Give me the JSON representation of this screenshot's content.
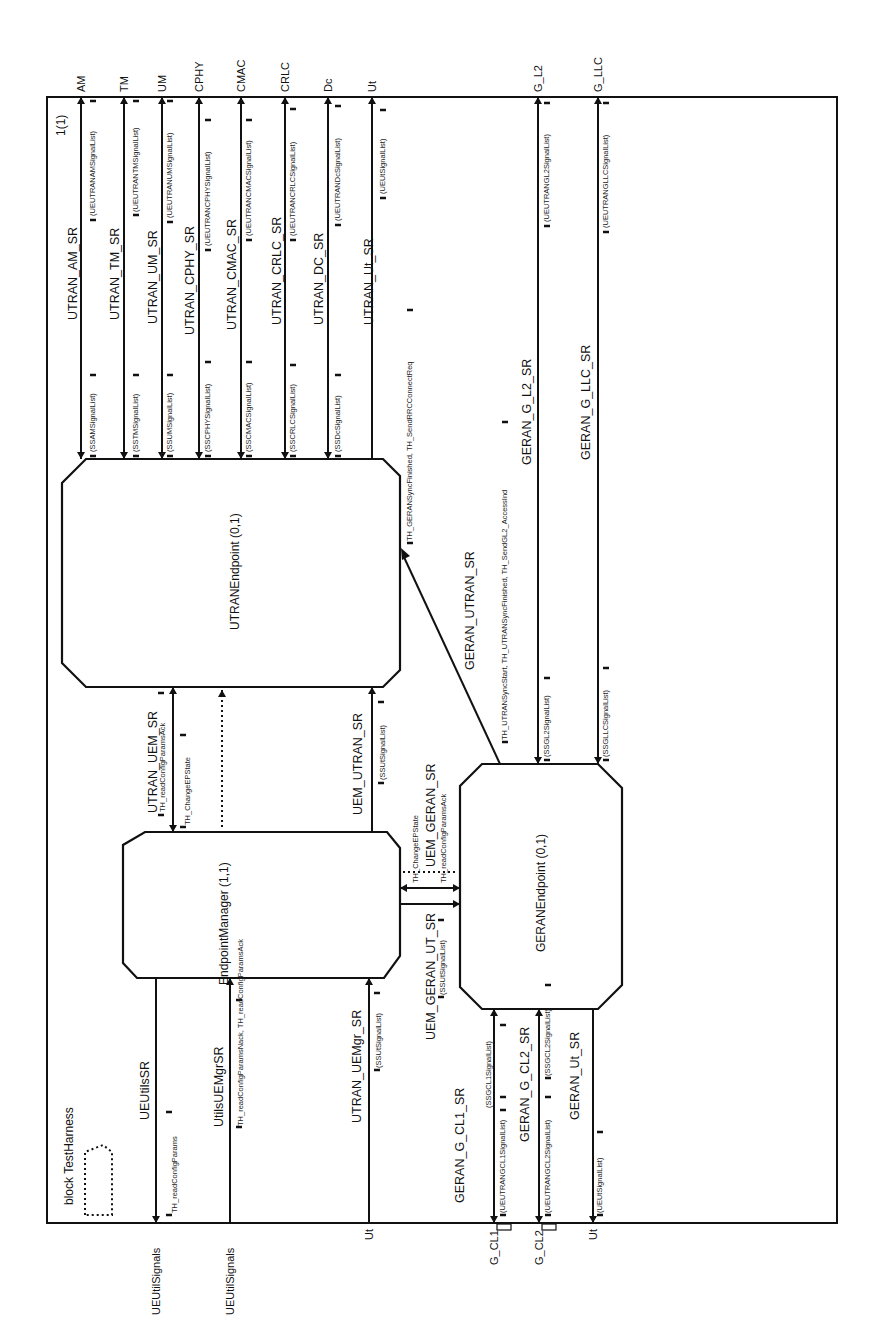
{
  "diagram": {
    "title": "block TestHarness",
    "page": "1(1)",
    "orientation": "rotated-90-ccw",
    "colors": {
      "line": "#111111",
      "background": "#ffffff"
    },
    "blocks": {
      "utran": "UTRANEndpoint (0,1)",
      "manager": "EndpointManager (1,1)",
      "geran": "GERANEndpoint (0,1)"
    },
    "top_channels": [
      {
        "name": "AM",
        "route": "UTRAN_AM_SR",
        "in": "(UEUTRANAMSignalList)",
        "out": "(SSAMSignalList)"
      },
      {
        "name": "TM",
        "route": "UTRAN_TM_SR",
        "in": "(UEUTRANTMSignalList)",
        "out": "(SSTMSignalList)"
      },
      {
        "name": "UM",
        "route": "UTRAN_UM_SR",
        "in": "(UEUTRANUMSignalList)",
        "out": "(SSUMSignalList)"
      },
      {
        "name": "CPHY",
        "route": "UTRAN_CPHY_SR",
        "in": "(UEUTRANCPHYSignalList)",
        "out": "(SSCPHYSignalList)"
      },
      {
        "name": "CMAC",
        "route": "UTRAN_CMAC_SR",
        "in": "(UEUTRANCMACSignalList)",
        "out": "(SSCMACSignalList)"
      },
      {
        "name": "CRLC",
        "route": "UTRAN_CRLC_SR",
        "in": "(UEUTRANCRLCSignalList)",
        "out": "(SSCRLCSignalList)"
      },
      {
        "name": "Dc",
        "route": "UTRAN_DC_SR",
        "in": "(UEUTRANDcSignalList)",
        "out": "(SSDcSignalList)"
      },
      {
        "name": "Ut",
        "route": "UTRAN_Ut_SR",
        "in": "(UEUtSignalList)",
        "out": ""
      },
      {
        "name": "G_L2",
        "route": "GERAN_G_L2_SR",
        "in": "(UEUTRANGL2SignalList)",
        "out": "(SSGL2SignalList)"
      },
      {
        "name": "G_LLC",
        "route": "GERAN_G_LLC_SR",
        "in": "(UEUTRANGLLCSignalList)",
        "out": "(SSGLLCSignalList)"
      }
    ],
    "bottom_channels": [
      {
        "name": "UEUtilSignals",
        "route": "UEUtilsSR",
        "sig": "TH_readConfigParams"
      },
      {
        "name": "UEUtilSignals",
        "route": "UtilsUEMgrSR",
        "sig": "TH_readConfigParamsNack, TH_readConfigParamsAck"
      },
      {
        "name": "Ut",
        "route": "UTRAN_UEMgr_SR",
        "sig": "(SSUtSignalList)"
      },
      {
        "name": "G_CL1",
        "route": "GERAN_G_CL1_SR",
        "sig": "(UEUTRANGCL1SignalList)",
        "sig2": "(SSGCL1SignalList)"
      },
      {
        "name": "G_CL2",
        "route": "GERAN_G_CL2_SR",
        "sig": "(UEUTRANGCL2SignalList)",
        "sig2": "(SSGCL2SignalList)"
      },
      {
        "name": "Ut",
        "route": "GERAN_Ut_SR",
        "sig": "(UEUtSignalList)"
      }
    ],
    "internal_routes": {
      "utran_uem": {
        "route": "UTRAN_UEM_SR",
        "sig1": "TH_readConfigParamsAck",
        "sig2": "TH_ChangeEPState"
      },
      "uem_utran": {
        "route": "UEM_UTRAN_SR",
        "sig": "(SSUtSignalList)"
      },
      "uem_geran": {
        "route": "UEM_GERAN_SR",
        "sig1": "TH_ChangeEPState",
        "sig2": "TH_readConfigParamsAck"
      },
      "uem_geran_ut": {
        "route": "UEM_GERAN_UT_SR",
        "sig": "(SSUtSignalList)"
      },
      "geran_utran": {
        "route": "GERAN_UTRAN_SR",
        "sig1": "TH_GERANSyncFinished, TH_SendRRCConnectReq",
        "sig2": "TH_UTRANSyncStart, TH_UTRANSyncFinished, TH_SendGL2_AccessInd"
      }
    }
  }
}
